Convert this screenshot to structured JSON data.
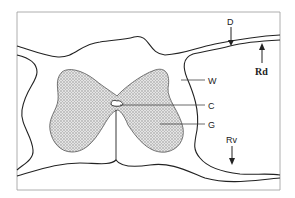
{
  "diagram": {
    "type": "anatomical cross-section (spinal cord)",
    "labels": {
      "D": "D",
      "Rd": "Rd",
      "W": "W",
      "C": "C",
      "G": "G",
      "Rv": "Rv"
    },
    "colors": {
      "outline": "#222222",
      "gray_matter_fill": "#c8c8c8",
      "frame": "#999999",
      "background": "#ffffff"
    }
  }
}
